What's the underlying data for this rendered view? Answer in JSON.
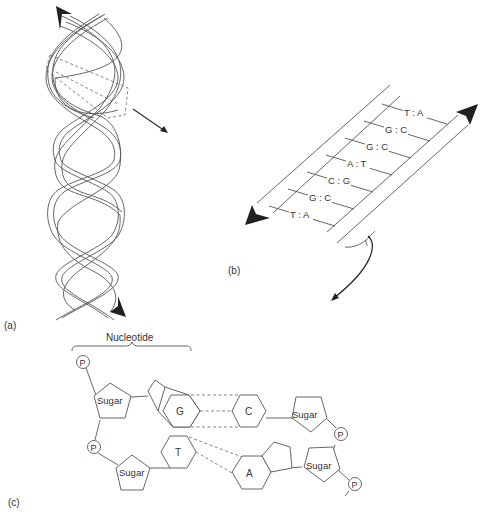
{
  "panels": {
    "a": {
      "label": "(a)",
      "description": "DNA double helix with dashed box highlighting a segment and an arrow pointing to panel (b)"
    },
    "b": {
      "label": "(b)",
      "description": "Unwound DNA ladder with base pairs between antiparallel strands",
      "base_pairs": [
        "T : A",
        "G : C",
        "G : C",
        "A : T",
        "C : G",
        "G : C",
        "T : A"
      ]
    },
    "c": {
      "label": "(c)",
      "description": "Nucleotide structure: sugar-phosphate backbone with paired bases",
      "bracket_label": "Nucleotide",
      "phosphate_label": "P",
      "sugar_label": "Sugar",
      "bases": {
        "g": "G",
        "c": "C",
        "t": "T",
        "a": "A"
      }
    }
  }
}
